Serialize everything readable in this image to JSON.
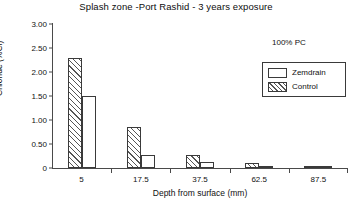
{
  "chart_data": {
    "type": "bar",
    "title": "Splash zone -Port Rashid - 3 years exposure",
    "xlabel": "Depth from surface (mm)",
    "ylabel": "Chloride (%Cl)",
    "categories": [
      "5",
      "17.5",
      "37.5",
      "62.5",
      "87.5"
    ],
    "series": [
      {
        "name": "Control",
        "style": "hatched",
        "values": [
          2.3,
          0.85,
          0.27,
          0.1,
          0.03
        ]
      },
      {
        "name": "Zemdrain",
        "style": "open",
        "values": [
          1.5,
          0.27,
          0.12,
          0.02,
          0.02
        ]
      }
    ],
    "ylim": [
      0,
      3.0
    ],
    "yticks": [
      "0",
      "0.50",
      "1.00",
      "1.50",
      "2.00",
      "2.50",
      "3.00"
    ],
    "ytick_values": [
      0,
      0.5,
      1.0,
      1.5,
      2.0,
      2.5,
      3.0
    ],
    "grid": false,
    "legend_position": "top-right",
    "legend": [
      {
        "label": "Zemdrain",
        "style": "open"
      },
      {
        "label": "Control",
        "style": "hatched"
      }
    ],
    "annotations": [
      {
        "text": "100% PC"
      }
    ]
  }
}
